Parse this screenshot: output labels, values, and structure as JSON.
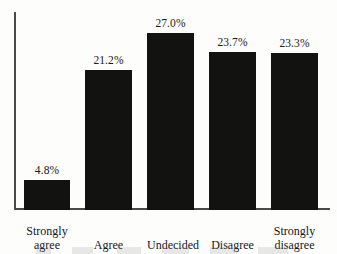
{
  "chart_data": {
    "type": "bar",
    "title": "",
    "subtitle": "",
    "xlabel": "",
    "ylabel": "",
    "grid": false,
    "legend": "none",
    "ylim": [
      0,
      30
    ],
    "categories": [
      "Strongly agree",
      "Agree",
      "Undecided",
      "Disagree",
      "Strongly disagree"
    ],
    "category_lines": [
      [
        "Strongly",
        "agree"
      ],
      [
        "Agree"
      ],
      [
        "Undecided"
      ],
      [
        "Disagree"
      ],
      [
        "Strongly",
        "disagree"
      ]
    ],
    "values": [
      4.8,
      21.2,
      27.0,
      23.7,
      23.3
    ],
    "data_labels": [
      "4.8%",
      "21.2%",
      "27.0%",
      "23.7%",
      "23.3%"
    ],
    "bar_color": "#121210",
    "axis_color": "#4a4a48",
    "background_color": "#fdfdfb"
  },
  "geometry": {
    "bars": [
      {
        "left": 24,
        "width": 46,
        "top": 180
      },
      {
        "left": 85,
        "width": 47,
        "top": 70
      },
      {
        "left": 147,
        "width": 47,
        "top": 33
      },
      {
        "left": 209,
        "width": 47,
        "top": 52
      },
      {
        "left": 271,
        "width": 47,
        "top": 53
      }
    ],
    "baseline_y": 210
  }
}
